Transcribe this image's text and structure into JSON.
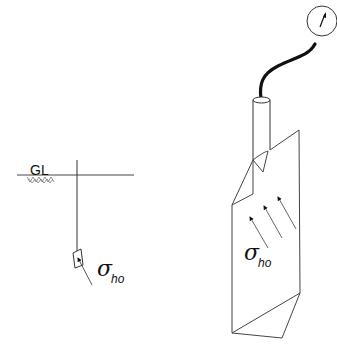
{
  "figure": {
    "left_panel": {
      "ground_label": "GL",
      "stress_symbol": "σ",
      "stress_subscript": "ho"
    },
    "right_panel": {
      "stress_symbol": "σ",
      "stress_subscript": "ho",
      "arrow_count": 3,
      "gauge": "pressure-gauge"
    },
    "colors": {
      "line": "#333333",
      "background": "#ffffff"
    }
  }
}
